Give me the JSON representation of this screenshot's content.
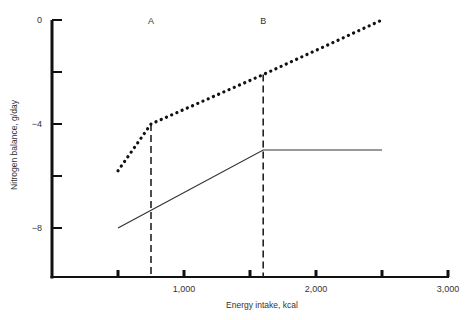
{
  "chart_data": {
    "type": "line",
    "title": "",
    "xlabel": "Energy intake, kcal",
    "ylabel": "Nitrogen balance, g/day",
    "xlim": [
      0,
      3000
    ],
    "ylim": [
      -10,
      0
    ],
    "x_ticks": [
      500,
      1000,
      1500,
      2000,
      2500,
      3000
    ],
    "x_tick_labels": [
      {
        "value": 1000,
        "label": "1,000"
      },
      {
        "value": 2000,
        "label": "2,000"
      },
      {
        "value": 3000,
        "label": "3,000"
      }
    ],
    "y_ticks": [
      0,
      -2,
      -4,
      -6,
      -8
    ],
    "y_tick_labels": [
      {
        "value": 0,
        "label": "0"
      },
      {
        "value": -4,
        "label": "−4"
      },
      {
        "value": -8,
        "label": "−8"
      }
    ],
    "grid": false,
    "series": [
      {
        "name": "upper-dotted",
        "style": "dotted",
        "x": [
          500,
          750,
          1600,
          2500
        ],
        "y": [
          -5.8,
          -4.0,
          -2.1,
          0.0
        ]
      },
      {
        "name": "lower-solid",
        "style": "solid",
        "x": [
          500,
          1600,
          2500
        ],
        "y": [
          -8.0,
          -5.0,
          -5.0
        ]
      }
    ],
    "reference_lines": [
      {
        "label": "A",
        "x": 750
      },
      {
        "label": "B",
        "x": 1600
      }
    ]
  }
}
